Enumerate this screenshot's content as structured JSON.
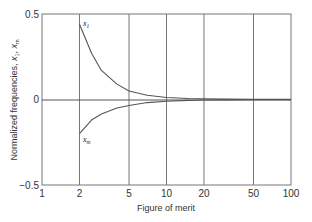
{
  "chart_data": {
    "type": "line",
    "title": "",
    "xlabel": "Figure of merit",
    "ylabel": "Normalized frequencies, x1, xm",
    "ylabel_parts": {
      "prefix": "Normalized frequencies, ",
      "v1": "x",
      "v1_sub": "1",
      "sep": ", ",
      "v2": "x",
      "v2_sub": "m"
    },
    "xscale": "log",
    "xlim": [
      1,
      100
    ],
    "ylim": [
      -0.5,
      0.5
    ],
    "x_ticks": [
      "1",
      "2",
      "5",
      "10",
      "20",
      "50",
      "100"
    ],
    "y_ticks": [
      "0.5",
      "0",
      "−0.5"
    ],
    "grid": "vertical lines at x ticks, horizontal line at y=0",
    "series": [
      {
        "name": "x1",
        "label": "x",
        "label_sub": "1",
        "x": [
          2,
          2.5,
          3,
          4,
          5,
          7,
          10,
          15,
          20,
          30,
          50,
          100
        ],
        "y": [
          0.44,
          0.27,
          0.17,
          0.09,
          0.05,
          0.025,
          0.012,
          0.006,
          0.004,
          0.002,
          0.001,
          0.0005
        ]
      },
      {
        "name": "xm",
        "label": "x",
        "label_sub": "m",
        "x": [
          2,
          2.5,
          3,
          4,
          5,
          7,
          10,
          15,
          20,
          30,
          50,
          100
        ],
        "y": [
          -0.2,
          -0.12,
          -0.085,
          -0.05,
          -0.035,
          -0.018,
          -0.01,
          -0.005,
          -0.003,
          -0.002,
          -0.001,
          -0.0005
        ]
      }
    ],
    "colors": {
      "line": "#555555",
      "axis": "#666666",
      "text": "#333333"
    }
  }
}
